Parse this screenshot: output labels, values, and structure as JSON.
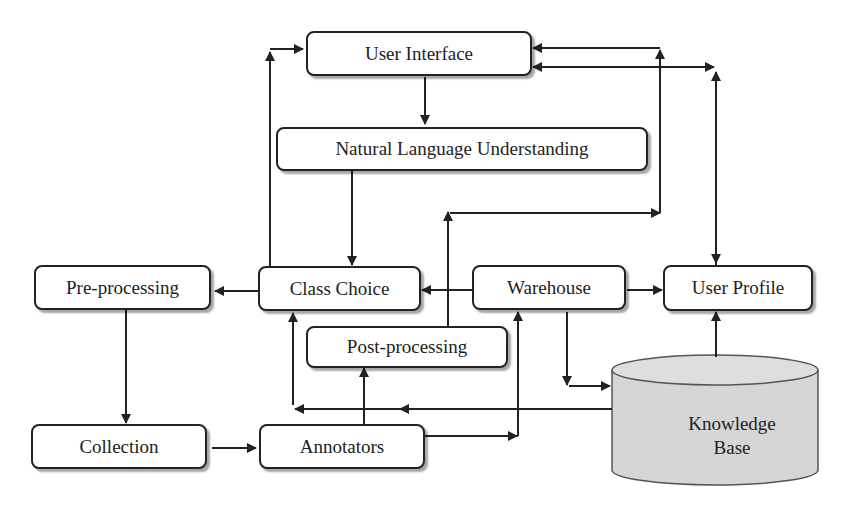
{
  "diagram": {
    "nodes": {
      "user_interface": "User Interface",
      "nlu": "Natural Language Understanding",
      "pre_processing": "Pre-processing",
      "class_choice": "Class Choice",
      "warehouse": "Warehouse",
      "user_profile": "User Profile",
      "post_processing": "Post-processing",
      "collection": "Collection",
      "annotators": "Annotators",
      "knowledge_base_line1": "Knowledge",
      "knowledge_base_line2": "Base"
    },
    "colors": {
      "stroke": "#222222",
      "database_fill": "#d6d6d6",
      "background": "#ffffff"
    },
    "edges": [
      {
        "from": "User Interface",
        "to": "Natural Language Understanding"
      },
      {
        "from": "Natural Language Understanding",
        "to": "Class Choice"
      },
      {
        "from": "Class Choice",
        "to": "Pre-processing"
      },
      {
        "from": "Class Choice",
        "to": "User Interface"
      },
      {
        "from": "Pre-processing",
        "to": "Collection"
      },
      {
        "from": "Collection",
        "to": "Annotators"
      },
      {
        "from": "Annotators",
        "to": "Post-processing"
      },
      {
        "from": "Annotators",
        "to": "Warehouse"
      },
      {
        "from": "Post-processing",
        "to": "User Interface"
      },
      {
        "from": "Warehouse",
        "to": "Class Choice"
      },
      {
        "from": "Warehouse",
        "to": "User Profile"
      },
      {
        "from": "Warehouse",
        "to": "Knowledge Base"
      },
      {
        "from": "Knowledge Base",
        "to": "Class Choice"
      },
      {
        "from": "Knowledge Base",
        "to": "User Profile"
      },
      {
        "from": "User Profile",
        "to": "User Interface",
        "bidirectional": true
      }
    ]
  }
}
